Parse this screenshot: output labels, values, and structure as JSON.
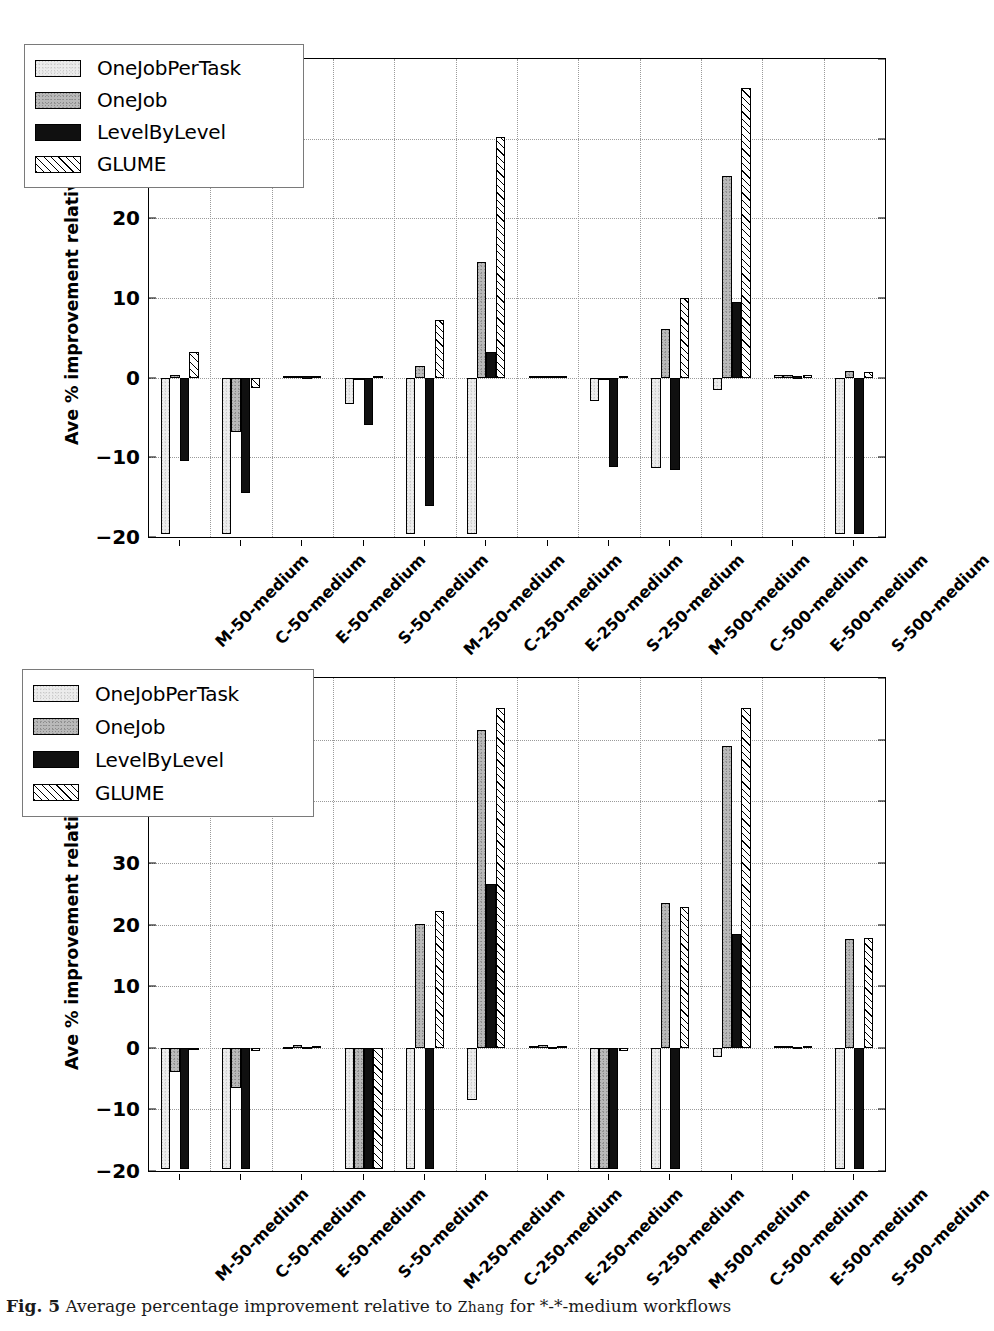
{
  "figure": {
    "caption_label": "Fig. 5",
    "caption_text_1": "Average percentage improvement relative to",
    "caption_smallcaps": "Zhang",
    "caption_text_2": "for *-*-medium workflows"
  },
  "legend": {
    "entries": [
      {
        "label": "OneJobPerTask",
        "pattern": "light-speckle",
        "color": "#ececec"
      },
      {
        "label": "OneJob",
        "pattern": "grey-speckle",
        "color": "#b9b9b9"
      },
      {
        "label": "LevelByLevel",
        "pattern": "solid-black",
        "color": "#101010"
      },
      {
        "label": "GLUME",
        "pattern": "diagonal-hatch",
        "color": "#ffffff"
      }
    ]
  },
  "chart_data": [
    {
      "type": "bar",
      "panel": "top",
      "title": "",
      "xlabel": "",
      "ylabel": "Ave % improvement relative to Zhang",
      "ylim": [
        -20,
        40
      ],
      "yticks": [
        -20,
        -10,
        0,
        10,
        20,
        30,
        40
      ],
      "grid": true,
      "legend_position": "upper-left",
      "categories": [
        "M-50-medium",
        "C-50-medium",
        "E-50-medium",
        "S-50-medium",
        "M-250-medium",
        "C-250-medium",
        "E-250-medium",
        "S-250-medium",
        "M-500-medium",
        "C-500-medium",
        "E-500-medium",
        "S-500-medium"
      ],
      "series": [
        {
          "name": "OneJobPerTask",
          "values": [
            -19.6,
            -19.6,
            0.2,
            -3.3,
            -19.6,
            -19.6,
            0.2,
            -2.9,
            -11.3,
            -1.5,
            0.3,
            -19.6
          ]
        },
        {
          "name": "OneJob",
          "values": [
            0.3,
            -6.8,
            0.25,
            -0.2,
            1.5,
            14.5,
            0.25,
            -0.3,
            6.1,
            25.3,
            0.35,
            0.85
          ]
        },
        {
          "name": "LevelByLevel",
          "values": [
            -10.5,
            -14.5,
            0.15,
            -6.0,
            -16.1,
            3.2,
            0.2,
            -11.2,
            -11.6,
            9.5,
            0.15,
            -19.6
          ]
        },
        {
          "name": "GLUME",
          "values": [
            3.2,
            -1.3,
            0.2,
            0.2,
            7.3,
            30.2,
            0.2,
            0.2,
            10.0,
            36.4,
            0.3,
            0.7
          ]
        }
      ]
    },
    {
      "type": "bar",
      "panel": "bottom",
      "title": "",
      "xlabel": "",
      "ylabel": "Ave % improvement relative to Zhang",
      "ylim": [
        -20,
        60
      ],
      "yticks": [
        -20,
        -10,
        0,
        10,
        20,
        30,
        40,
        50,
        60
      ],
      "grid": true,
      "legend_position": "upper-left",
      "categories": [
        "M-50-medium",
        "C-50-medium",
        "E-50-medium",
        "S-50-medium",
        "M-250-medium",
        "C-250-medium",
        "E-250-medium",
        "S-250-medium",
        "M-500-medium",
        "C-500-medium",
        "E-500-medium",
        "S-500-medium"
      ],
      "series": [
        {
          "name": "OneJobPerTask",
          "values": [
            -19.6,
            -19.6,
            0.2,
            -19.6,
            -19.6,
            -8.5,
            0.3,
            -19.6,
            -19.6,
            -1.5,
            0.3,
            -19.6
          ]
        },
        {
          "name": "OneJob",
          "values": [
            -3.9,
            -6.6,
            0.4,
            -19.6,
            20.1,
            51.5,
            0.5,
            -19.6,
            23.5,
            49.0,
            0.35,
            17.7
          ]
        },
        {
          "name": "LevelByLevel",
          "values": [
            -19.6,
            -19.6,
            0.2,
            -19.6,
            -19.6,
            26.6,
            0.2,
            -19.6,
            -19.6,
            18.5,
            0.2,
            -19.6
          ]
        },
        {
          "name": "GLUME",
          "values": [
            -0.4,
            -0.5,
            0.3,
            -19.6,
            22.2,
            55.1,
            0.35,
            -0.5,
            22.8,
            55.1,
            0.3,
            17.8
          ]
        }
      ]
    }
  ]
}
